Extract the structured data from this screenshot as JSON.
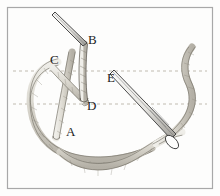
{
  "figure": {
    "background_color": "#fdfdfc",
    "border_color": "#a8a8a8",
    "thread_fill": "#d8d5cc",
    "thread_outline": "#6e6a61",
    "needle_outline": "#3a3a3a",
    "needle_fill": "#f2f1ee",
    "guide_line_color": "#b9b3a8",
    "label_color": "#1c1c1c",
    "labels": [
      {
        "id": "label-a",
        "text": "A",
        "x": 66,
        "y": 136
      },
      {
        "id": "label-b",
        "text": "B",
        "x": 88,
        "y": 44
      },
      {
        "id": "label-c",
        "text": "C",
        "x": 50,
        "y": 64
      },
      {
        "id": "label-d",
        "text": "D",
        "x": 87,
        "y": 110
      },
      {
        "id": "label-e",
        "text": "E",
        "x": 107,
        "y": 82
      }
    ],
    "guide_lines": [
      {
        "id": "guide-upper",
        "y": 71,
        "x1": 13,
        "x2": 207
      },
      {
        "id": "guide-lower",
        "y": 104,
        "x1": 13,
        "x2": 207
      }
    ]
  }
}
